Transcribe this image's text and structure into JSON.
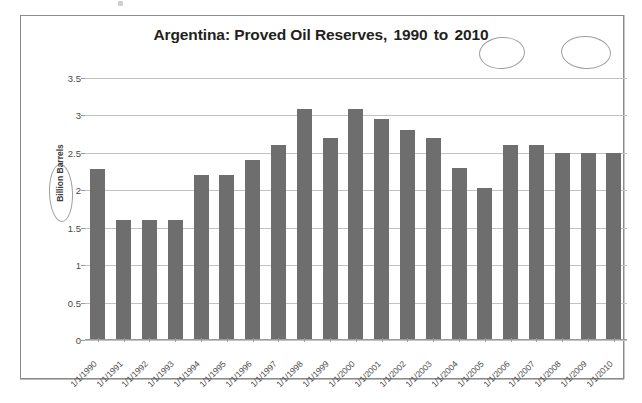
{
  "page": {
    "background_color": "#ffffff",
    "scan_artifact": "scan-speck"
  },
  "chart_frame": {
    "border_color": "#8b8b8b",
    "background_color": "#ffffff"
  },
  "annotations": {
    "style": "hand-drawn-pencil-ellipse",
    "color": "#8e8e8e",
    "items": [
      {
        "name": "ellipse-around-1990",
        "target": "1990"
      },
      {
        "name": "ellipse-around-2010",
        "target": "2010"
      },
      {
        "name": "ellipse-around-barrels",
        "target": "Barrels"
      }
    ]
  },
  "title_parts": {
    "lead": "Argentina: Proved Oil Reserves,",
    "start_year": "1990",
    "connector": "to",
    "end_year": "2010"
  },
  "chart_data": {
    "type": "bar",
    "title": "Argentina: Proved Oil Reserves, 1990 to 2010",
    "xlabel": "",
    "ylabel": "Billion Barrels",
    "ylim": [
      0,
      3.5
    ],
    "ytick_labels": [
      "3.5",
      "3",
      "2.5",
      "2",
      "1.5",
      "1",
      "0.5",
      "0"
    ],
    "yticks": [
      3.5,
      3,
      2.5,
      2,
      1.5,
      1,
      0.5,
      0
    ],
    "grid": true,
    "legend": null,
    "bar_color": "#6e6e6e",
    "categories": [
      "1/1/1990",
      "1/1/1991",
      "1/1/1992",
      "1/1/1993",
      "1/1/1994",
      "1/1/1995",
      "1/1/1996",
      "1/1/1997",
      "1/1/1998",
      "1/1/1999",
      "1/1/2000",
      "1/1/2001",
      "1/1/2002",
      "1/1/2003",
      "1/1/2004",
      "1/1/2005",
      "1/1/2006",
      "1/1/2007",
      "1/1/2008",
      "1/1/2009",
      "1/1/2010"
    ],
    "values": [
      2.28,
      1.6,
      1.6,
      1.6,
      2.2,
      2.2,
      2.4,
      2.6,
      3.08,
      2.7,
      3.08,
      2.95,
      2.8,
      2.7,
      2.3,
      2.03,
      2.6,
      2.6,
      2.5,
      2.5,
      2.5
    ]
  }
}
